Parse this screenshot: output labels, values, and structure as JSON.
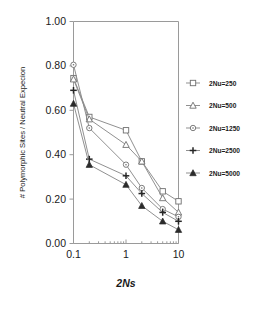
{
  "chart_data": {
    "type": "line",
    "title": "",
    "xlabel": "2Ns",
    "ylabel": "# Polymorphic Sites / Neutral Expecion",
    "xscale": "log",
    "xlim": [
      0.1,
      10
    ],
    "ylim": [
      0.0,
      1.0
    ],
    "grid": false,
    "legend_position": "right",
    "x": [
      0.1,
      0.2,
      1,
      2,
      5,
      10
    ],
    "xticks": [
      "0.1",
      "1",
      "10"
    ],
    "xtick_values": [
      0.1,
      1,
      10
    ],
    "yticks": [
      "0.00",
      "0.20",
      "0.40",
      "0.60",
      "0.80",
      "1.00"
    ],
    "ytick_values": [
      0.0,
      0.2,
      0.4,
      0.6,
      0.8,
      1.0
    ],
    "series": [
      {
        "name": "2Nu=250",
        "marker": "open-square",
        "values": [
          0.745,
          0.57,
          0.51,
          0.37,
          0.235,
          0.19
        ]
      },
      {
        "name": "2Nu=500",
        "marker": "open-triangle",
        "values": [
          0.74,
          0.56,
          0.445,
          0.37,
          0.205,
          0.14
        ]
      },
      {
        "name": "2Nu=1250",
        "marker": "open-circle",
        "values": [
          0.805,
          0.52,
          0.355,
          0.25,
          0.155,
          0.12
        ]
      },
      {
        "name": "2Nu=2500",
        "marker": "plus",
        "values": [
          0.69,
          0.38,
          0.305,
          0.225,
          0.14,
          0.1
        ]
      },
      {
        "name": "2Nu=5000",
        "marker": "filled-triangle",
        "values": [
          0.63,
          0.355,
          0.265,
          0.17,
          0.1,
          0.062
        ]
      }
    ]
  },
  "legend": {
    "entries": [
      {
        "label": "2Nu=250"
      },
      {
        "label": "2Nu=500"
      },
      {
        "label": "2Nu=1250"
      },
      {
        "label": "2Nu=2500"
      },
      {
        "label": "2Nu=5000"
      }
    ]
  },
  "axes": {
    "y_title": "# Polymorphic Sites / Neutral Expecion",
    "x_title": "2Ns",
    "y_tick_0": "0.00",
    "y_tick_1": "0.20",
    "y_tick_2": "0.40",
    "y_tick_3": "0.60",
    "y_tick_4": "0.80",
    "y_tick_5": "1.00",
    "x_tick_0": "0.1",
    "x_tick_1": "1",
    "x_tick_2": "10"
  },
  "colors": {
    "line": "#8a8a8a",
    "marker_stroke": "#6f6f6f",
    "marker_fill_open": "#ffffff",
    "marker_fill_solid": "#2b2b2b",
    "axis": "#9a9a9a",
    "text": "#1a1a1a",
    "background": "#ffffff"
  }
}
